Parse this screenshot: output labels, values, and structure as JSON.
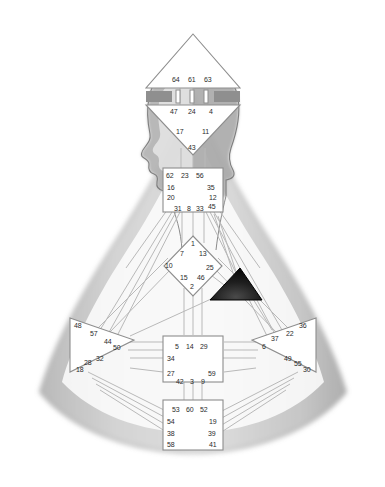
{
  "image": {
    "title": "Human Design BodyGraph over human silhouette",
    "background_color": "#ffffff",
    "silhouette_color": "#c9c9c9",
    "silhouette_edge_color": "#9a9a9a",
    "center_fill_color": "#ffffff",
    "center_stroke_color": "#8d8d8d",
    "channel_color": "#b5b5b5",
    "defined_center_fill": "#1a1a1a",
    "number_color": "#2b2b2b"
  },
  "centers": [
    {
      "name": "head",
      "shape": "triangle-up",
      "defined": false,
      "gates": [
        "64",
        "61",
        "63"
      ]
    },
    {
      "name": "ajna",
      "shape": "triangle-down",
      "defined": false,
      "gates_top": [
        "47",
        "24",
        "4"
      ],
      "gates_bottom": [
        "17",
        "11",
        "43"
      ]
    },
    {
      "name": "throat",
      "shape": "square",
      "defined": false,
      "gates_top": [
        "62",
        "23",
        "56"
      ],
      "gates_left": [
        "16",
        "20"
      ],
      "gates_right": [
        "35",
        "12"
      ],
      "gates_bottom": [
        "31",
        "8",
        "33",
        "45"
      ]
    },
    {
      "name": "g-center",
      "shape": "diamond",
      "defined": false,
      "gates_top": [
        "1"
      ],
      "gates_upper": [
        "7",
        "13"
      ],
      "gates_left": [
        "10"
      ],
      "gates_right": [
        "25"
      ],
      "gates_lower": [
        "15",
        "46"
      ],
      "gates_bottom": [
        "2"
      ]
    },
    {
      "name": "heart-ego",
      "shape": "triangle-left",
      "defined": true,
      "gates": [
        "21",
        "40",
        "26",
        "51"
      ]
    },
    {
      "name": "spleen",
      "shape": "triangle-right",
      "defined": false,
      "gates": [
        "48",
        "57",
        "44",
        "50",
        "32",
        "28",
        "18"
      ]
    },
    {
      "name": "solar-plexus",
      "shape": "triangle-left",
      "defined": false,
      "gates": [
        "36",
        "22",
        "37",
        "6",
        "49",
        "55",
        "30"
      ]
    },
    {
      "name": "sacral",
      "shape": "square",
      "defined": false,
      "gates_top": [
        "5",
        "14",
        "29"
      ],
      "gates_left": [
        "34",
        "27"
      ],
      "gates_right": [
        "59"
      ],
      "gates_bottom": [
        "42",
        "3",
        "9"
      ]
    },
    {
      "name": "root",
      "shape": "square",
      "defined": false,
      "gates_top": [
        "53",
        "60",
        "52"
      ],
      "gates_left": [
        "54",
        "38",
        "58"
      ],
      "gates_right": [
        "19",
        "39",
        "41"
      ]
    }
  ],
  "gate_labels": {
    "head_64": "64",
    "head_61": "61",
    "head_63": "63",
    "ajna_47": "47",
    "ajna_24": "24",
    "ajna_4": "4",
    "ajna_17": "17",
    "ajna_11": "11",
    "ajna_43": "43",
    "throat_62": "62",
    "throat_23": "23",
    "throat_56": "56",
    "throat_16": "16",
    "throat_35": "35",
    "throat_20": "20",
    "throat_12": "12",
    "throat_31": "31",
    "throat_8": "8",
    "throat_33": "33",
    "throat_45": "45",
    "g_1": "1",
    "g_7": "7",
    "g_13": "13",
    "g_10": "10",
    "g_25": "25",
    "g_15": "15",
    "g_46": "46",
    "g_2": "2",
    "spleen_48": "48",
    "spleen_57": "57",
    "spleen_44": "44",
    "spleen_50": "50",
    "spleen_32": "32",
    "spleen_28": "28",
    "spleen_18": "18",
    "sp_36": "36",
    "sp_22": "22",
    "sp_37": "37",
    "sp_6": "6",
    "sp_49": "49",
    "sp_55": "55",
    "sp_30": "30",
    "sacral_5": "5",
    "sacral_14": "14",
    "sacral_29": "29",
    "sacral_34": "34",
    "sacral_27": "27",
    "sacral_59": "59",
    "sacral_42": "42",
    "sacral_3": "3",
    "sacral_9": "9",
    "root_53": "53",
    "root_60": "60",
    "root_52": "52",
    "root_54": "54",
    "root_19": "19",
    "root_38": "38",
    "root_39": "39",
    "root_58": "58",
    "root_41": "41"
  }
}
